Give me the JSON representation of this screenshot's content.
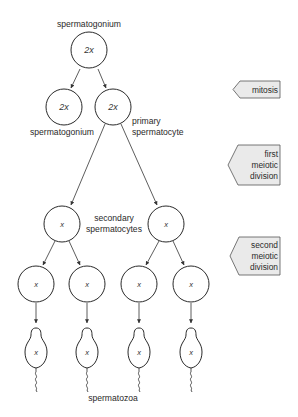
{
  "diagram": {
    "nodes": {
      "top_spermatogonium": {
        "label": "spermatogonium",
        "ploidy": "2x"
      },
      "spermatogonium_daughter": {
        "label": "spermatogonium",
        "ploidy": "2x"
      },
      "primary_spermatocyte": {
        "label_line1": "primary",
        "label_line2": "spermatocyte",
        "ploidy": "2x"
      },
      "secondary_spermatocytes": {
        "label_line1": "secondary",
        "label_line2": "spermatocytes",
        "ploidy": "x"
      },
      "spermatid_ploidy": "x",
      "spermatozoa": {
        "label": "spermatozoa",
        "ploidy": "x"
      }
    },
    "stages": [
      {
        "name": "mitosis",
        "lines": [
          "mitosis"
        ]
      },
      {
        "name": "first-meiotic-division",
        "lines": [
          "first",
          "meiotic",
          "division"
        ]
      },
      {
        "name": "second-meiotic-division",
        "lines": [
          "second",
          "meiotic",
          "division"
        ]
      }
    ],
    "colors": {
      "stage_fill": "#eaeaea",
      "stroke": "#2a2a2a",
      "background": "#ffffff"
    }
  }
}
